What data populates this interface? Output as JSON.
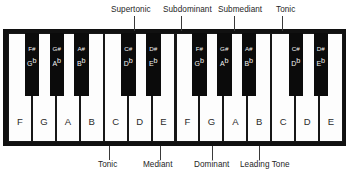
{
  "diagram": {
    "colors": {
      "white_key": "#fdfdfd",
      "black_key": "#0b0b0b",
      "frame": "#111111",
      "text": "#262626",
      "black_key_text": "#f2f2f2"
    }
  },
  "annotations": {
    "top": [
      {
        "label": "Supertonic",
        "label_x": 111,
        "line_x": 134
      },
      {
        "label": "Subdominant",
        "label_x": 163,
        "line_x": 181
      },
      {
        "label": "Submediant",
        "label_x": 218,
        "line_x": 234
      },
      {
        "label": "Tonic",
        "label_x": 276,
        "line_x": 282
      }
    ],
    "bottom": [
      {
        "label": "Tonic",
        "label_x": 98,
        "line_x": 109
      },
      {
        "label": "Mediant",
        "label_x": 143,
        "line_x": 160
      },
      {
        "label": "Dominant",
        "label_x": 194,
        "line_x": 212
      },
      {
        "label": "Leading Tone",
        "label_x": 240,
        "line_x": 259
      }
    ]
  },
  "keyboard": {
    "white_keys": [
      {
        "note": "F",
        "x": 0
      },
      {
        "note": "G",
        "x": 23.93
      },
      {
        "note": "A",
        "x": 47.86
      },
      {
        "note": "B",
        "x": 71.79
      },
      {
        "note": "C",
        "x": 95.71
      },
      {
        "note": "D",
        "x": 119.64
      },
      {
        "note": "E",
        "x": 143.57
      },
      {
        "note": "F",
        "x": 167.5
      },
      {
        "note": "G",
        "x": 191.43
      },
      {
        "note": "A",
        "x": 215.36
      },
      {
        "note": "B",
        "x": 239.29
      },
      {
        "note": "C",
        "x": 263.21
      },
      {
        "note": "D",
        "x": 287.14
      },
      {
        "note": "E",
        "x": 311.07
      }
    ],
    "white_key_width": 23.93,
    "black_keys": [
      {
        "sharp": "F#",
        "flat": "G",
        "x": 16.5
      },
      {
        "sharp": "G#",
        "flat": "A",
        "x": 41.5
      },
      {
        "sharp": "A#",
        "flat": "B",
        "x": 66.0
      },
      {
        "sharp": "C#",
        "flat": "D",
        "x": 113.0
      },
      {
        "sharp": "D#",
        "flat": "E",
        "x": 138.0
      },
      {
        "sharp": "F#",
        "flat": "G",
        "x": 184.0
      },
      {
        "sharp": "G#",
        "flat": "A",
        "x": 209.0
      },
      {
        "sharp": "A#",
        "flat": "B",
        "x": 233.5
      },
      {
        "sharp": "C#",
        "flat": "D",
        "x": 280.5
      },
      {
        "sharp": "D#",
        "flat": "E",
        "x": 305.5
      }
    ],
    "black_key_width": 14.5,
    "flat_symbol": "b"
  }
}
